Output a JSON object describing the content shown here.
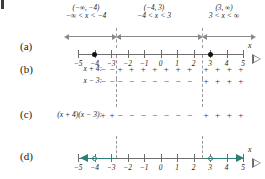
{
  "figure": {
    "type": "sign-chart-number-line",
    "rows": [
      {
        "letter": "(a)"
      },
      {
        "letter": "(b)"
      },
      {
        "letter": "(c)"
      },
      {
        "letter": "(d)"
      }
    ]
  },
  "intervals": [
    {
      "notation": "(−∞, −4)",
      "inequality": "−∞ < x < −4"
    },
    {
      "notation": "(−4, 3)",
      "inequality": "−4 < x < 3"
    },
    {
      "notation": "(3, ∞)",
      "inequality": "3 < x < ∞"
    }
  ],
  "number_line": {
    "min": -5,
    "max": 5,
    "tick_labels": [
      "−5",
      "−4",
      "−3",
      "−2",
      "−1",
      "0",
      "1",
      "2",
      "3",
      "4",
      "5"
    ],
    "axis_label": "x",
    "critical_values": [
      -4,
      3
    ]
  },
  "sign_rows": [
    {
      "label": "x + 4:",
      "signs_left": [
        "−",
        "−"
      ],
      "signs_middle": [
        "+",
        "+",
        "+",
        "+",
        "+",
        "+",
        "+"
      ],
      "signs_right": [
        "+",
        "+",
        "+",
        "+"
      ]
    },
    {
      "label": "x − 3:",
      "signs_left": [
        "−",
        "−"
      ],
      "signs_middle": [
        "−",
        "−",
        "−",
        "−",
        "−",
        "−",
        "−"
      ],
      "signs_right": [
        "+",
        "+",
        "+",
        "+"
      ]
    },
    {
      "label": "(x + 4)(x − 3):",
      "signs_left": [
        "+",
        "+"
      ],
      "signs_middle": [
        "−",
        "−",
        "−",
        "−",
        "−",
        "−",
        "−"
      ],
      "signs_right": [
        "+",
        "+",
        "+",
        "+"
      ]
    }
  ],
  "solution": {
    "open_points": [
      -4,
      3
    ],
    "rays": [
      "left-from--4",
      "right-from-3"
    ],
    "color": "#2d7d79"
  }
}
